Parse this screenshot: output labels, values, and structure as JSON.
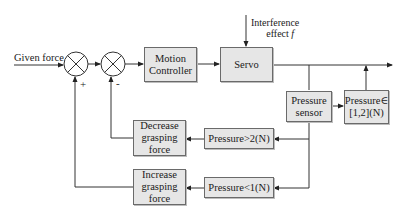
{
  "diagram": {
    "type": "closed-loop grasping force control block diagram",
    "input_label": "Given force",
    "disturbance_label": "Interference effect f",
    "disturbance_line1": "Interference",
    "disturbance_line2": "effect ",
    "disturbance_symbol": "f",
    "summing_junctions": [
      {
        "id": "sum1",
        "feedback_sign": "+"
      },
      {
        "id": "sum2",
        "feedback_sign": "-"
      }
    ],
    "blocks": {
      "motion_controller": {
        "line1": "Motion",
        "line2": "Controller"
      },
      "servo": {
        "line1": "Servo"
      },
      "pressure_sensor": {
        "line1": "Pressure",
        "line2": "sensor"
      },
      "pressure_in_range": {
        "line1": "Pressure∈",
        "line2": "[1,2](N)"
      },
      "pressure_gt2": {
        "line1": "Pressure>2(N)"
      },
      "pressure_lt1": {
        "line1": "Pressure<1(N)"
      },
      "decrease_force": {
        "line1": "Decrease",
        "line2": "grasping",
        "line3": "force"
      },
      "increase_force": {
        "line1": "Increase",
        "line2": "grasping",
        "line3": "force"
      }
    },
    "colors": {
      "block_fill": "#e6e6e6",
      "line": "#333333",
      "border": "#6a6a6a"
    }
  }
}
